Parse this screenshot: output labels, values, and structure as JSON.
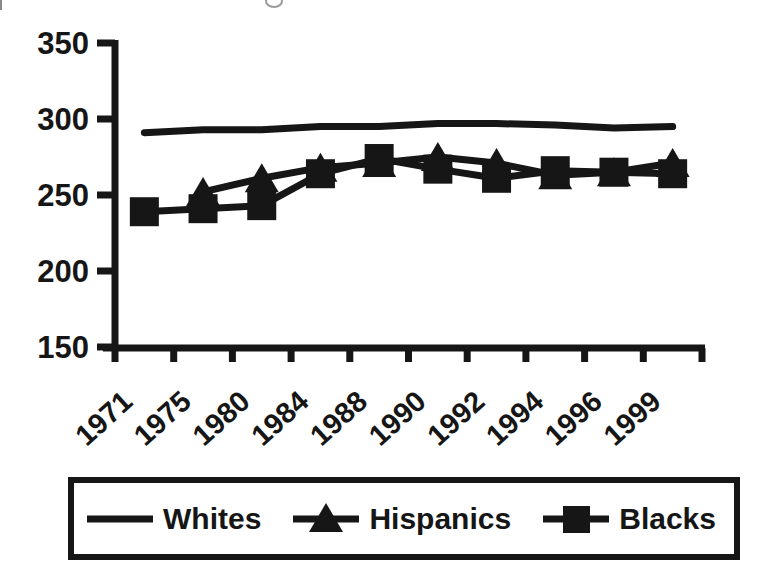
{
  "figure": {
    "background": "#ffffff",
    "ink": "#161616"
  },
  "chart_data": {
    "type": "line",
    "title": "",
    "xlabel": "",
    "ylabel": "",
    "categories": [
      "1971",
      "1975",
      "1980",
      "1984",
      "1988",
      "1990",
      "1992",
      "1994",
      "1996",
      "1999"
    ],
    "series": [
      {
        "name": "Whites",
        "marker": "none",
        "color": "#161616",
        "values": [
          291,
          293,
          293,
          295,
          295,
          297,
          297,
          296,
          294,
          295
        ]
      },
      {
        "name": "Hispanics",
        "marker": "triangle",
        "color": "#161616",
        "values": [
          null,
          252,
          261,
          268,
          271,
          275,
          271,
          263,
          265,
          271
        ]
      },
      {
        "name": "Blacks",
        "marker": "square",
        "color": "#161616",
        "values": [
          239,
          241,
          243,
          264,
          274,
          267,
          261,
          266,
          265,
          264
        ]
      }
    ],
    "ylim": [
      150,
      350
    ],
    "yticks": [
      150,
      200,
      250,
      300,
      350
    ],
    "grid": false,
    "legend_position": "bottom"
  }
}
